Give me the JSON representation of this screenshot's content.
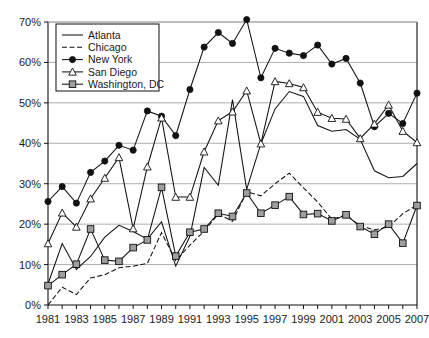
{
  "chart_data": {
    "type": "line",
    "title": "",
    "xlabel": "",
    "ylabel": "",
    "xlim": [
      1981,
      2007
    ],
    "ylim": [
      0,
      70
    ],
    "grid": true,
    "legend_position": "top-left",
    "y_ticks": [
      "0%",
      "10%",
      "20%",
      "30%",
      "40%",
      "50%",
      "60%",
      "70%"
    ],
    "y_tick_values": [
      0,
      10,
      20,
      30,
      40,
      50,
      60,
      70
    ],
    "x_ticks": [
      "1981",
      "1983",
      "1985",
      "1987",
      "1989",
      "1991",
      "1993",
      "1995",
      "1997",
      "1999",
      "2001",
      "2003",
      "2005",
      "2007"
    ],
    "x": [
      1981,
      1982,
      1983,
      1984,
      1985,
      1986,
      1987,
      1988,
      1989,
      1990,
      1991,
      1992,
      1993,
      1994,
      1995,
      1996,
      1997,
      1998,
      1999,
      2000,
      2001,
      2002,
      2003,
      2004,
      2005,
      2006,
      2007
    ],
    "series": [
      {
        "name": "Atlanta",
        "marker": "none",
        "dash": "solid",
        "values": [
          5.2,
          15.2,
          8.8,
          12.0,
          16.8,
          19.7,
          18.2,
          16.3,
          20.6,
          9.6,
          17.0,
          34.0,
          29.6,
          50.8,
          28.6,
          39.9,
          48.5,
          52.8,
          51.6,
          44.4,
          43.0,
          43.4,
          41.0,
          33.2,
          31.5,
          31.8,
          35.0
        ]
      },
      {
        "name": "Chicago",
        "marker": "none",
        "dash": "dashed",
        "values": [
          0.0,
          4.4,
          2.6,
          6.7,
          7.5,
          9.2,
          9.6,
          10.3,
          17.9,
          11.0,
          14.8,
          18.3,
          22.5,
          20.7,
          28.0,
          27.0,
          30.0,
          32.6,
          29.0,
          25.5,
          21.2,
          22.3,
          19.5,
          18.6,
          19.3,
          22.6,
          24.7
        ]
      },
      {
        "name": "New York",
        "marker": "circle",
        "dash": "solid",
        "values": [
          25.6,
          29.3,
          25.2,
          32.8,
          35.6,
          39.5,
          38.3,
          48.0,
          46.7,
          41.9,
          53.3,
          63.8,
          67.4,
          64.7,
          70.6,
          56.2,
          63.5,
          62.3,
          61.7,
          64.3,
          59.6,
          61.0,
          54.9,
          44.1,
          47.4,
          44.9,
          52.4
        ]
      },
      {
        "name": "San Diego",
        "marker": "triangle",
        "dash": "solid",
        "values": [
          15.2,
          22.8,
          19.3,
          26.3,
          31.4,
          36.5,
          18.9,
          34.2,
          46.3,
          26.7,
          26.7,
          37.9,
          45.6,
          47.8,
          53.0,
          39.9,
          55.3,
          54.8,
          53.8,
          47.7,
          46.2,
          46.0,
          41.2,
          44.8,
          49.5,
          43.0,
          40.2
        ]
      },
      {
        "name": "Washington, DC",
        "marker": "square",
        "dash": "solid",
        "values": [
          4.8,
          7.5,
          10.1,
          18.8,
          11.1,
          10.8,
          14.2,
          16.1,
          29.1,
          12.1,
          18.0,
          18.8,
          22.7,
          21.9,
          27.7,
          22.7,
          24.7,
          26.8,
          22.4,
          22.6,
          20.8,
          22.3,
          19.4,
          17.5,
          20.0,
          15.3,
          24.6
        ]
      }
    ]
  },
  "legend": {
    "items": [
      {
        "label": "Atlanta"
      },
      {
        "label": "Chicago"
      },
      {
        "label": "New York"
      },
      {
        "label": "San Diego"
      },
      {
        "label": "Washington, DC"
      }
    ]
  }
}
